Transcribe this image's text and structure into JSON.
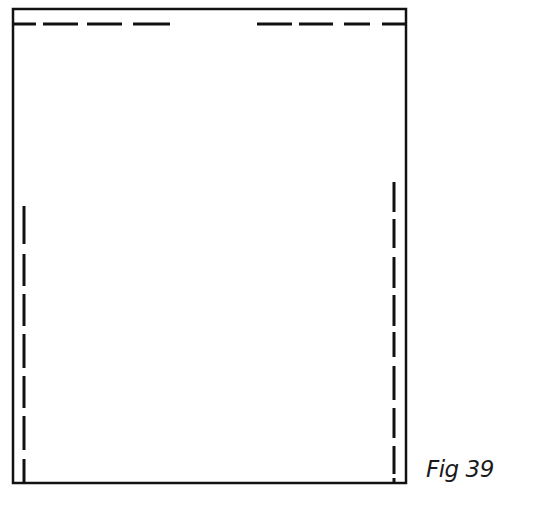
{
  "figure": {
    "label": "Fig 39",
    "stroke_color": "#111111",
    "background": "#ffffff",
    "outline": {
      "x1": 13,
      "y1": 9,
      "x2": 406,
      "y2": 483,
      "stroke_width": 2.5
    },
    "dashed_lines": {
      "top": {
        "y": 24,
        "segments": [
          [
            13,
            36
          ],
          [
            43,
            78
          ],
          [
            87,
            122
          ],
          [
            133,
            170
          ],
          [
            257,
            292
          ],
          [
            299,
            333
          ],
          [
            344,
            370
          ],
          [
            382,
            406
          ]
        ]
      },
      "left": {
        "x": 24,
        "segments": [
          [
            206,
            244
          ],
          [
            254,
            286
          ],
          [
            294,
            326
          ],
          [
            334,
            368
          ],
          [
            376,
            408
          ],
          [
            416,
            450
          ],
          [
            459,
            483
          ]
        ]
      },
      "right": {
        "x": 394,
        "segments": [
          [
            182,
            212
          ],
          [
            219,
            248
          ],
          [
            257,
            288
          ],
          [
            295,
            326
          ],
          [
            332,
            357
          ],
          [
            366,
            400
          ],
          [
            408,
            438
          ],
          [
            446,
            474
          ],
          [
            478,
            483
          ]
        ]
      }
    }
  }
}
